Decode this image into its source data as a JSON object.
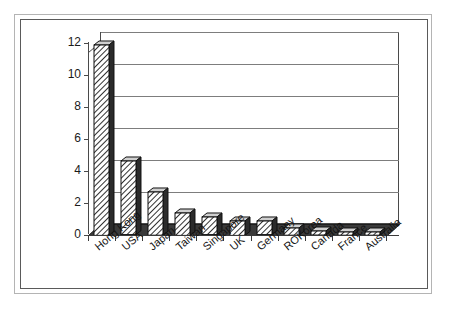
{
  "chart_data": {
    "type": "bar",
    "title": "",
    "subtitle": "",
    "xlabel": "",
    "ylabel": "",
    "categories": [
      "Hong Kong",
      "USA",
      "Japan",
      "Taiwan",
      "Singapore",
      "UK",
      "Germany",
      "ROKorea",
      "Canada",
      "France",
      "Australia"
    ],
    "values": [
      11.9,
      4.6,
      2.7,
      1.4,
      1.1,
      0.9,
      0.85,
      0.45,
      0.25,
      0.2,
      0.2
    ],
    "series": [
      {
        "name": "",
        "values": [
          11.9,
          4.6,
          2.7,
          1.4,
          1.1,
          0.9,
          0.85,
          0.45,
          0.25,
          0.2,
          0.2
        ]
      }
    ],
    "ylim": [
      0,
      12
    ],
    "yticks": [
      0,
      2,
      4,
      6,
      8,
      10,
      12
    ],
    "ytick_labels": [
      "0",
      "2",
      "4",
      "6",
      "8",
      "10",
      "12"
    ],
    "grid": true,
    "grid_axis": "y",
    "legend": false,
    "legend_position": "none",
    "style": "3d-column",
    "bar_fill": "diagonal-hatch",
    "bar_colors": {
      "face": "#ffffff",
      "hatch": "#1a1a1a",
      "side": "#2b2b2b",
      "outline": "#111111"
    },
    "plot_colors": {
      "background": "#ffffff",
      "gridline": "#7d7d7d",
      "axis": "#4a4a4a",
      "floor": "#3a3a3a",
      "frame": "#5a5a5a",
      "page_border": "#b4b4b4",
      "text": "#141414"
    },
    "annotations": []
  }
}
